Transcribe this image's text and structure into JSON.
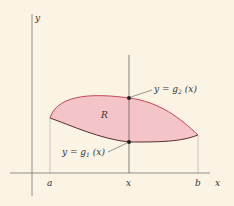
{
  "figure": {
    "axes": {
      "x_label": "x",
      "y_label": "y"
    },
    "ticks": {
      "a": "a",
      "x": "x",
      "b": "b"
    },
    "region": {
      "label": "R",
      "fill_color": "#f5c4c8",
      "edge_color": "#c0485a"
    },
    "curves": {
      "upper": {
        "label_prefix": "y = g",
        "subscript": "2",
        "label_suffix": " (x)"
      },
      "lower": {
        "label_prefix": "y = g",
        "subscript": "1",
        "label_suffix": " (x)"
      }
    },
    "colors": {
      "background": "#fbf3e4",
      "axis": "#666666",
      "dot": "#222222"
    }
  }
}
